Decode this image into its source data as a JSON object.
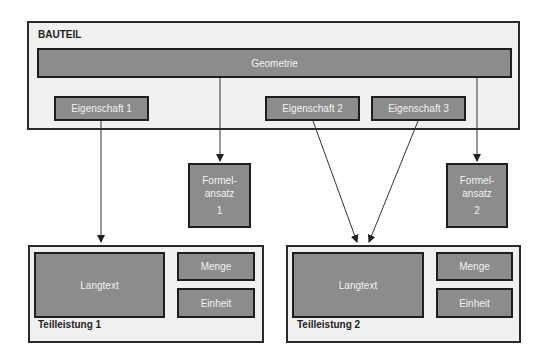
{
  "bauteil": {
    "title": "BAUTEIL",
    "geometrie": "Geometrie",
    "eigenschaften": [
      "Eigenschaft 1",
      "Eigenschaft 2",
      "Eigenschaft 3"
    ]
  },
  "formelansatz": [
    {
      "line1": "Formel-",
      "line2": "ansatz",
      "number": "1"
    },
    {
      "line1": "Formel-",
      "line2": "ansatz",
      "number": "2"
    }
  ],
  "teilleistungen": [
    {
      "title": "Teilleistung 1",
      "langtext": "Langtext",
      "menge": "Menge",
      "einheit": "Einheit"
    },
    {
      "title": "Teilleistung 2",
      "langtext": "Langtext",
      "menge": "Menge",
      "einheit": "Einheit"
    }
  ],
  "colors": {
    "container_fill": "#f0f0f0",
    "box_fill": "#8c8c8c",
    "border": "#1e1e1e",
    "box_text": "#f2f2f2"
  }
}
